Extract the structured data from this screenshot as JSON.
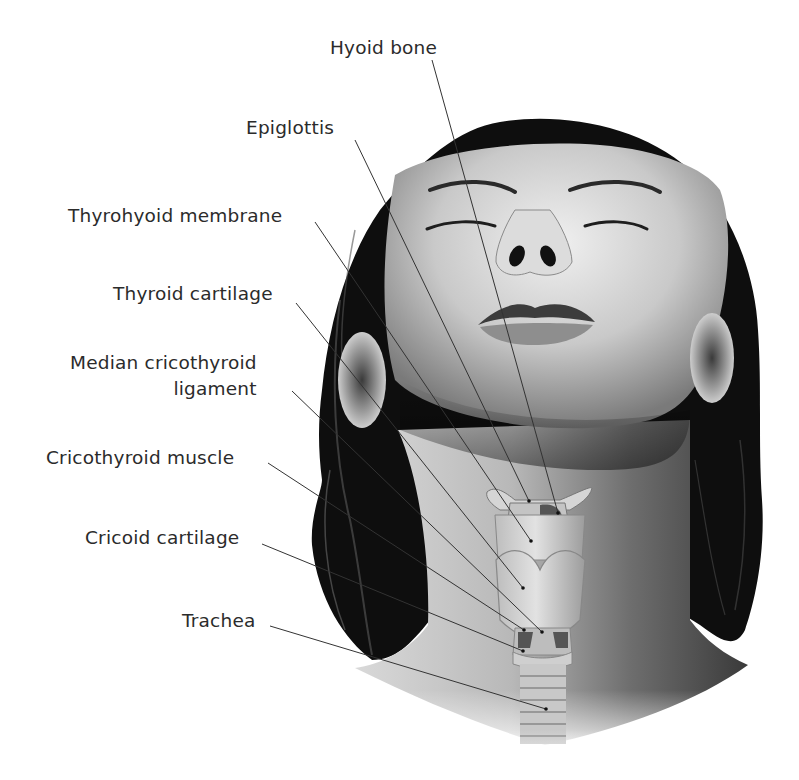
{
  "diagram": {
    "colors": {
      "label_text": "#2b2b2b",
      "leader_line": "#333333",
      "hair": "#0d0d0d",
      "skin_light": "#e8e8e8",
      "skin_mid": "#a9a9a9",
      "skin_dark": "#4a4a4a",
      "cartilage": "#cfcfcf",
      "background": "#ffffff"
    },
    "labels": [
      {
        "id": "hyoid-bone",
        "text": "Hyoid bone",
        "x": 330,
        "y": 39,
        "line": {
          "x1": 432,
          "y1": 60,
          "x2": 558,
          "y2": 513
        }
      },
      {
        "id": "epiglottis",
        "text": "Epiglottis",
        "x": 246,
        "y": 119,
        "line": {
          "x1": 355,
          "y1": 140,
          "x2": 529,
          "y2": 501
        }
      },
      {
        "id": "thyrohyoid-membrane",
        "text": "Thyrohyoid membrane",
        "x": 68,
        "y": 207,
        "line": {
          "x1": 315,
          "y1": 222,
          "x2": 531,
          "y2": 541
        }
      },
      {
        "id": "thyroid-cartilage",
        "text": "Thyroid cartilage",
        "x": 113,
        "y": 285,
        "line": {
          "x1": 296,
          "y1": 303,
          "x2": 523,
          "y2": 588
        }
      },
      {
        "id": "median-cricothyroid-ligament",
        "text": "Median cricothyroid",
        "text2": "ligament",
        "x": 70,
        "y": 354,
        "line": {
          "x1": 292,
          "y1": 391,
          "x2": 542,
          "y2": 632
        }
      },
      {
        "id": "cricothyroid-muscle",
        "text": "Cricothyroid muscle",
        "x": 46,
        "y": 449,
        "line": {
          "x1": 268,
          "y1": 463,
          "x2": 524,
          "y2": 630
        }
      },
      {
        "id": "cricoid-cartilage",
        "text": "Cricoid cartilage",
        "x": 85,
        "y": 529,
        "line": {
          "x1": 262,
          "y1": 544,
          "x2": 523,
          "y2": 651
        }
      },
      {
        "id": "trachea",
        "text": "Trachea",
        "x": 182,
        "y": 612,
        "line": {
          "x1": 270,
          "y1": 626,
          "x2": 546,
          "y2": 709
        }
      }
    ]
  }
}
